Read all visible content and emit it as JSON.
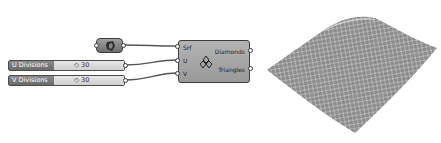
{
  "canvas": {
    "surface_param": {
      "icon": "surface-icon"
    },
    "sliders": [
      {
        "label": "U Divisions",
        "value": "30"
      },
      {
        "label": "V Divisions",
        "value": "30"
      }
    ],
    "component": {
      "icon": "diamond-panels-icon",
      "inputs": [
        "Srf",
        "U",
        "V"
      ],
      "outputs": [
        "Diamonds",
        "Triangles"
      ]
    }
  },
  "viewport": {
    "preview": "diamond-paneled-surface"
  }
}
